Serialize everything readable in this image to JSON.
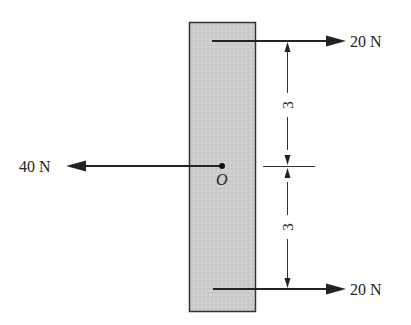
{
  "diagram": {
    "type": "free-body-diagram",
    "body": {
      "shape": "rectangle",
      "fill": "#cfcfcf",
      "stroke": "#333333"
    },
    "point": {
      "label": "O"
    },
    "forces": [
      {
        "id": "top",
        "label": "20 N",
        "direction": "right"
      },
      {
        "id": "left",
        "label": "40 N",
        "direction": "left"
      },
      {
        "id": "bottom",
        "label": "20 N",
        "direction": "right"
      }
    ],
    "dimensions": [
      {
        "id": "upper",
        "value": "3"
      },
      {
        "id": "lower",
        "value": "3"
      }
    ]
  }
}
